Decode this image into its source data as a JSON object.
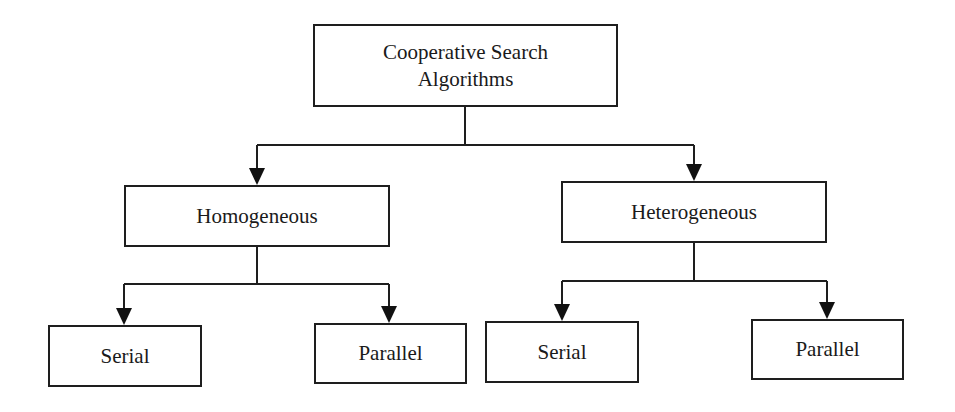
{
  "diagram": {
    "type": "tree",
    "root": {
      "label_line1": "Cooperative Search",
      "label_line2": "Algorithms"
    },
    "level1": [
      {
        "label": "Homogeneous"
      },
      {
        "label": "Heterogeneous"
      }
    ],
    "level2": {
      "homogeneous": [
        {
          "label": "Serial"
        },
        {
          "label": "Parallel"
        }
      ],
      "heterogeneous": [
        {
          "label": "Serial"
        },
        {
          "label": "Parallel"
        }
      ]
    },
    "colors": {
      "line": "#1e1e1e",
      "background": "#ffffff",
      "text": "#1a1a1a"
    }
  }
}
